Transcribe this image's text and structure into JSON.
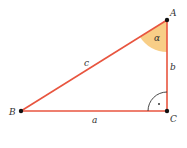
{
  "diagram": {
    "vertices": [
      {
        "id": "A",
        "label": "A",
        "x": 167,
        "y": 20
      },
      {
        "id": "B",
        "label": "B",
        "x": 21,
        "y": 111
      },
      {
        "id": "C",
        "label": "C",
        "x": 167,
        "y": 111
      }
    ],
    "sides": [
      {
        "id": "a",
        "label": "a",
        "from": "B",
        "to": "C"
      },
      {
        "id": "b",
        "label": "b",
        "from": "C",
        "to": "A"
      },
      {
        "id": "c",
        "label": "c",
        "from": "A",
        "to": "B"
      }
    ],
    "angles": [
      {
        "vertex": "A",
        "label": "α",
        "kind": "acute"
      },
      {
        "vertex": "C",
        "label": "·",
        "kind": "right"
      }
    ],
    "colors": {
      "edge": "#e8553f",
      "angle_fill": "#f7c97a",
      "vertex": "#111111",
      "right_angle_arc": "#333333"
    }
  }
}
